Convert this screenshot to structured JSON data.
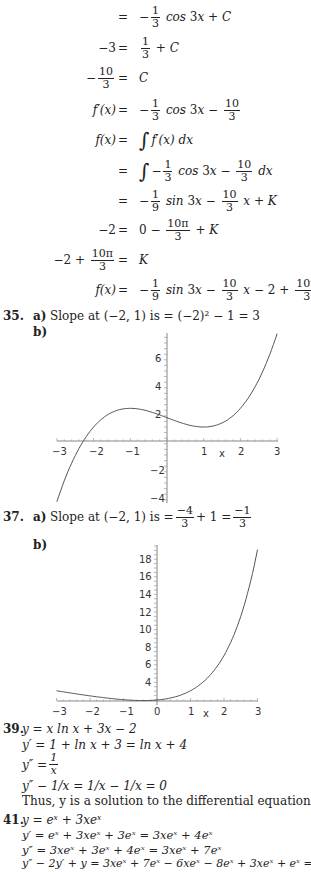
{
  "derivation": [
    {
      "lhs": "",
      "eq": "=",
      "rhs_parts": [
        "−",
        "1/3",
        "cos 3x + C"
      ]
    },
    {
      "lhs": "−3",
      "eq": "=",
      "rhs_parts": [
        "1/3",
        "+ C"
      ]
    },
    {
      "lhs": "−10/3",
      "eq": "=",
      "rhs_parts": [
        "C"
      ]
    },
    {
      "lhs": "f′(x)",
      "eq": "=",
      "rhs_parts": [
        "−",
        "1/3",
        "cos 3x −",
        "10/3"
      ]
    },
    {
      "lhs": "f(x)",
      "eq": "=",
      "rhs_parts": [
        "∫",
        "f′(x) dx"
      ]
    },
    {
      "lhs": "",
      "eq": "=",
      "rhs_parts": [
        "∫",
        "−",
        "1/3",
        "cos 3x −",
        "10/3",
        "dx"
      ]
    },
    {
      "lhs": "",
      "eq": "=",
      "rhs_parts": [
        "−",
        "1/9",
        "sin 3x −",
        "10/3",
        "x + K"
      ]
    },
    {
      "lhs": "−2",
      "eq": "=",
      "rhs_parts": [
        "0 −",
        "10π/3",
        "+ K"
      ]
    },
    {
      "lhs": "−2 + 10π/3",
      "eq": "=",
      "rhs_parts": [
        "K"
      ]
    },
    {
      "lhs": "f(x)",
      "eq": "=",
      "rhs_parts": [
        "−",
        "1/9",
        "sin 3x −",
        "10/3",
        "x − 2 +",
        "10π/3"
      ]
    }
  ],
  "problem35": {
    "number": "35.",
    "part_a_label": "a)",
    "part_a_text": "Slope at (−2, 1) is = (−2)² − 1 = 3",
    "part_b_label": "b)"
  },
  "problem37": {
    "number": "37.",
    "part_a_label": "a)",
    "part_a_prefix": "Slope at (−2, 1) is =",
    "frac1_num": "−4",
    "frac1_den": "3",
    "middle": "+ 1 =",
    "frac2_num": "−1",
    "frac2_den": "3",
    "part_b_label": "b)"
  },
  "problem39": {
    "number": "39.",
    "lines": [
      "y = x  ln x + 3x − 2",
      "y′ = 1 + ln x + 3 = ln x + 4",
      "y″ = 1/x",
      "y″ − 1/x = 1/x − 1/x = 0"
    ],
    "y2_lhs": "y″ =",
    "y2_num": "1",
    "y2_den": "x",
    "conclusion": "Thus, y is a solution to the differential equation"
  },
  "problem41": {
    "number": "41.",
    "lines": [
      "y = eˣ + 3xeˣ",
      "y′ = eˣ + 3xeˣ + 3eˣ = 3xeˣ + 4eˣ",
      "y″ = 3xeˣ + 3eˣ + 4eˣ = 3xeˣ + 7eˣ",
      "y″ − 2y′ + y = 3xeˣ + 7eˣ − 6xeˣ − 8eˣ + 3xeˣ + eˣ = 0"
    ]
  },
  "chart_data": [
    {
      "type": "line",
      "title": "",
      "xlabel": "x",
      "ylabel": "",
      "xlim": [
        -3,
        3
      ],
      "ylim": [
        -4.3,
        7.7
      ],
      "x_ticks": [
        "−3",
        "−2",
        "−1",
        "1",
        "2",
        "3"
      ],
      "y_ticks": [
        "−4",
        "−2",
        "2",
        "4",
        "6"
      ],
      "grid": false,
      "series": [
        {
          "name": "solution curve",
          "x": [
            -3,
            -2.5,
            -2,
            -1.5,
            -1,
            -0.5,
            0,
            0.5,
            1,
            1.5,
            2,
            2.5,
            3
          ],
          "y": [
            -4.33,
            -1.04,
            1.0,
            2.04,
            2.33,
            2.13,
            1.67,
            1.21,
            1.0,
            1.29,
            2.33,
            4.38,
            7.67
          ]
        }
      ]
    },
    {
      "type": "line",
      "title": "",
      "xlabel": "x",
      "ylabel": "",
      "xlim": [
        -3,
        3
      ],
      "ylim": [
        2,
        19.5
      ],
      "x_ticks": [
        "−3",
        "−2",
        "−1",
        "0",
        "1",
        "2",
        "3"
      ],
      "y_ticks": [
        "4",
        "6",
        "8",
        "10",
        "12",
        "14",
        "16",
        "18"
      ],
      "grid": false,
      "series": [
        {
          "name": "solution curve",
          "x": [
            -3,
            -2,
            -1,
            0,
            0.5,
            1,
            1.5,
            2,
            2.5,
            3
          ],
          "y": [
            3.05,
            2.47,
            2.03,
            2.0,
            2.32,
            2.05,
            3.48,
            6.06,
            10.52,
            19.09
          ]
        }
      ]
    }
  ],
  "graph1_labels": {
    "xm3": "−3",
    "xm2": "−2",
    "xm1": "−1",
    "x1": "1",
    "x2": "2",
    "x3": "3",
    "xl": "x",
    "y6": "6",
    "y4": "4",
    "y2": "2",
    "ym2": "−2",
    "ym4": "−4"
  },
  "graph2_labels": {
    "xm3": "−3",
    "xm2": "−2",
    "xm1": "−1",
    "x0": "0",
    "x1": "1",
    "x2": "2",
    "x3": "3",
    "xl": "x",
    "y4": "4",
    "y6": "6",
    "y8": "8",
    "y10": "10",
    "y12": "12",
    "y14": "14",
    "y16": "16",
    "y18": "18"
  }
}
